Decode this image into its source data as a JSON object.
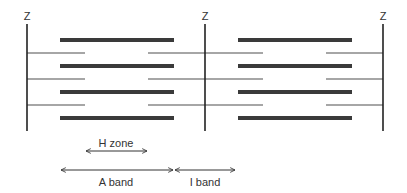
{
  "diagram": {
    "colors": {
      "z_line": "#222222",
      "thick_filament": "#3a3a3a",
      "thin_filament": "#a6a6a6",
      "arrow": "#333333",
      "text": "#333333"
    },
    "z_lines": [
      {
        "label": "Z",
        "x": 27
      },
      {
        "label": "Z",
        "x": 205
      },
      {
        "label": "Z",
        "x": 383
      }
    ],
    "thick_filaments": {
      "rows_y": [
        40,
        66,
        92,
        118
      ],
      "segments": [
        [
          60,
          174
        ],
        [
          238,
          352
        ]
      ]
    },
    "thin_filaments": {
      "rows_y": [
        53,
        79,
        105
      ],
      "segments": [
        [
          27,
          85
        ],
        [
          148,
          263
        ],
        [
          326,
          383
        ]
      ]
    },
    "labels": {
      "h_zone": "H zone",
      "a_band": "A band",
      "i_band": "I band"
    },
    "arrows": {
      "h_zone": {
        "x1": 85,
        "x2": 148,
        "y": 151
      },
      "a_band": {
        "x1": 60,
        "x2": 174,
        "y": 170
      },
      "i_band": {
        "x1": 174,
        "x2": 236,
        "y": 170
      }
    }
  }
}
